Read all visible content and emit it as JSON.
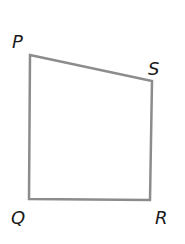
{
  "diagram": {
    "shape": "quadrilateral",
    "stroke_color": "#8c8c8c",
    "vertices": [
      {
        "label": "P",
        "x": 30,
        "y": 55
      },
      {
        "label": "S",
        "x": 152,
        "y": 81
      },
      {
        "label": "R",
        "x": 150,
        "y": 200
      },
      {
        "label": "Q",
        "x": 29,
        "y": 199
      }
    ],
    "labels": {
      "P": "P",
      "S": "S",
      "Q": "Q",
      "R": "R"
    }
  }
}
